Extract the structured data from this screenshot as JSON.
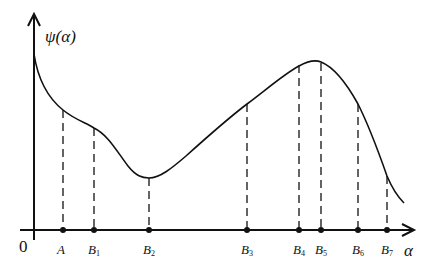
{
  "figure": {
    "y_axis_label": "ψ(α)",
    "x_axis_label": "α",
    "origin_label": "0",
    "colors": {
      "line": "#111111",
      "background": "#ffffff"
    },
    "points": [
      {
        "name": "A",
        "base": "A",
        "sub": "",
        "x": 63,
        "curve_y": 110
      },
      {
        "name": "B1",
        "base": "B",
        "sub": "1",
        "x": 94,
        "curve_y": 128
      },
      {
        "name": "B2",
        "base": "B",
        "sub": "2",
        "x": 149,
        "curve_y": 178
      },
      {
        "name": "B3",
        "base": "B",
        "sub": "3",
        "x": 247,
        "curve_y": 104
      },
      {
        "name": "B4",
        "base": "B",
        "sub": "4",
        "x": 299,
        "curve_y": 65
      },
      {
        "name": "B5",
        "base": "B",
        "sub": "5",
        "x": 321,
        "curve_y": 63
      },
      {
        "name": "B6",
        "base": "B",
        "sub": "6",
        "x": 358,
        "curve_y": 104
      },
      {
        "name": "B7",
        "base": "B",
        "sub": "7",
        "x": 387,
        "curve_y": 176
      }
    ]
  }
}
